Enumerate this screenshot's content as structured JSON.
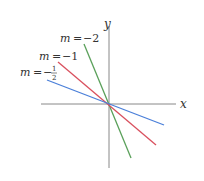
{
  "diagram": {
    "axes": {
      "x_label": "x",
      "y_label": "y",
      "color": "#888888"
    },
    "lines": [
      {
        "slope_label": "m = −2",
        "m_var": "m",
        "eq": "=",
        "value": "−2",
        "color": "#5aa05a"
      },
      {
        "slope_label": "m = −1",
        "m_var": "m",
        "eq": "=",
        "value": "−1",
        "color": "#d9505e"
      },
      {
        "slope_label": "m = −½",
        "m_var": "m",
        "eq": "=",
        "sign": "−",
        "numerator": "1",
        "denominator": "2",
        "color": "#4a7fd9"
      }
    ]
  }
}
